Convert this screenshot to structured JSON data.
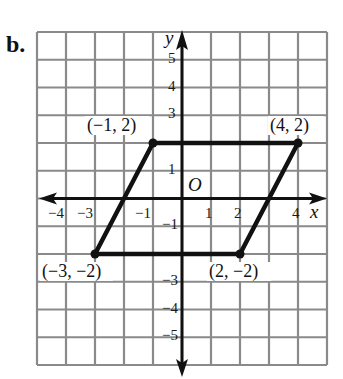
{
  "part_label": "b.",
  "chart_data": {
    "type": "line",
    "title": "",
    "xlabel": "x",
    "ylabel": "y",
    "origin_label": "O",
    "xlim": [
      -5,
      5
    ],
    "ylim": [
      -6,
      6
    ],
    "grid": true,
    "x_ticks": [
      {
        "value": -4,
        "label": "−4"
      },
      {
        "value": -3,
        "label": "−3"
      },
      {
        "value": -1,
        "label": "−1"
      },
      {
        "value": 1,
        "label": "1"
      },
      {
        "value": 2,
        "label": "2"
      },
      {
        "value": 4,
        "label": "4"
      }
    ],
    "y_ticks": [
      {
        "value": 5,
        "label": "5"
      },
      {
        "value": 4,
        "label": "4"
      },
      {
        "value": 3,
        "label": "3"
      },
      {
        "value": 1,
        "label": "1"
      },
      {
        "value": -1,
        "label": "−1"
      },
      {
        "value": -3,
        "label": "−3"
      },
      {
        "value": -4,
        "label": "−4"
      },
      {
        "value": -5,
        "label": "−5"
      }
    ],
    "series": [
      {
        "name": "parallelogram",
        "closed": true,
        "points": [
          {
            "x": -1,
            "y": 2,
            "label": "(−1, 2)"
          },
          {
            "x": 4,
            "y": 2,
            "label": "(4, 2)"
          },
          {
            "x": 2,
            "y": -2,
            "label": "(2, −2)"
          },
          {
            "x": -3,
            "y": -2,
            "label": "(−3, −2)"
          }
        ]
      }
    ]
  },
  "colors": {
    "grid": "#8a8a8a",
    "axis": "#111111",
    "shape": "#111111"
  }
}
